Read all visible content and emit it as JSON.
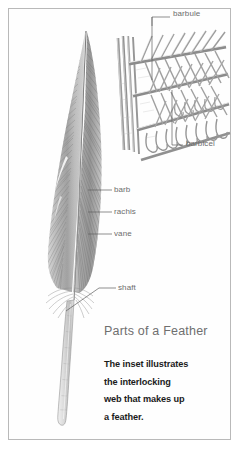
{
  "figure": {
    "title": "Parts of a Feather",
    "caption_lines": [
      "The inset illustrates",
      "the interlocking",
      "web that makes up",
      "a feather."
    ],
    "caption_text": "The inset illustrates the interlocking web that makes up a feather.",
    "frame_color": "#b9b9b9",
    "background_color": "#ffffff",
    "label_color": "#6d6d6d",
    "title_color": "#6f6f6f",
    "caption_color": "#1b1b1b",
    "ink_color": "#8a8a8a"
  },
  "main_diagram": {
    "subject": "feather",
    "labels": [
      {
        "id": "barb",
        "text": "barb",
        "x": 114,
        "y": 187
      },
      {
        "id": "rachis",
        "text": "rachis",
        "x": 114,
        "y": 209
      },
      {
        "id": "vane",
        "text": "vane",
        "x": 114,
        "y": 231
      },
      {
        "id": "shaft",
        "text": "shaft",
        "x": 118,
        "y": 285
      }
    ]
  },
  "inset_diagram": {
    "subject": "interlocking feather web",
    "labels": [
      {
        "id": "barbule",
        "text": "barbule",
        "x": 173,
        "y": 14
      },
      {
        "id": "barbicel",
        "text": "barbicel",
        "x": 186,
        "y": 142
      }
    ]
  }
}
